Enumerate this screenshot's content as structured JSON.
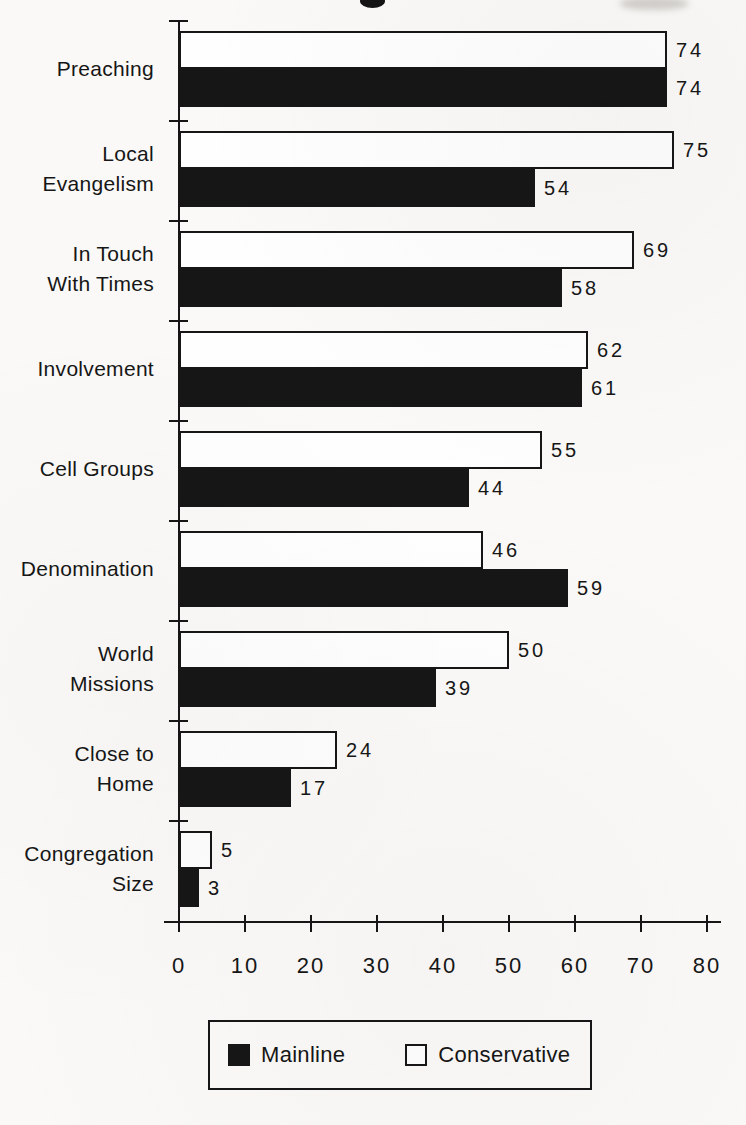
{
  "chart_data": {
    "type": "bar",
    "orientation": "horizontal",
    "categories": [
      "Preaching",
      "Local Evangelism",
      "In Touch With Times",
      "Involvement",
      "Cell Groups",
      "Denomination",
      "World Missions",
      "Close to Home",
      "Congregation Size"
    ],
    "label_lines": [
      [
        "Preaching"
      ],
      [
        "Local",
        "Evangelism"
      ],
      [
        "In Touch",
        "With Times"
      ],
      [
        "Involvement"
      ],
      [
        "Cell Groups"
      ],
      [
        "Denomination"
      ],
      [
        "World",
        "Missions"
      ],
      [
        "Close to",
        "Home"
      ],
      [
        "Congregation",
        "Size"
      ]
    ],
    "series": [
      {
        "name": "Mainline",
        "fill": "#161616",
        "border": "#161616",
        "values": [
          74,
          54,
          58,
          61,
          44,
          59,
          39,
          17,
          3
        ]
      },
      {
        "name": "Conservative",
        "fill": "#fefefe",
        "border": "#161616",
        "values": [
          74,
          75,
          69,
          62,
          55,
          46,
          50,
          24,
          5
        ]
      }
    ],
    "bar_order": [
      "Conservative",
      "Mainline"
    ],
    "xlim": [
      0,
      80
    ],
    "xticks": [
      0,
      10,
      20,
      30,
      40,
      50,
      60,
      70,
      80
    ],
    "value_labels": true,
    "grid": false,
    "legend": {
      "position": "bottom",
      "items": [
        "Mainline",
        "Conservative"
      ]
    }
  }
}
